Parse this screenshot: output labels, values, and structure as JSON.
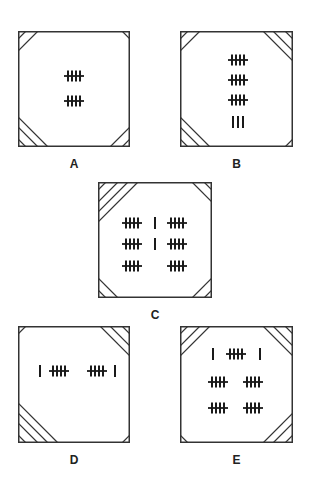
{
  "colors": {
    "stroke": "#333333",
    "background": "#ffffff"
  },
  "panels": [
    {
      "label": "A",
      "box": {
        "x": 18,
        "y": 31,
        "w": 112,
        "h": 116
      },
      "corners": {
        "tl": 2,
        "tr": 1,
        "bl": 3,
        "br": 2
      },
      "rows": [
        {
          "dy": 45,
          "items": [
            {
              "type": "five",
              "dx": 56
            }
          ]
        },
        {
          "dy": 70,
          "items": [
            {
              "type": "five",
              "dx": 56
            }
          ]
        }
      ],
      "tally_total": 10
    },
    {
      "label": "B",
      "box": {
        "x": 180,
        "y": 31,
        "w": 113,
        "h": 116
      },
      "corners": {
        "tl": 2,
        "tr": 3,
        "bl": 3,
        "br": 1
      },
      "rows": [
        {
          "dy": 29,
          "items": [
            {
              "type": "five",
              "dx": 58
            }
          ]
        },
        {
          "dy": 49,
          "items": [
            {
              "type": "five",
              "dx": 58
            }
          ]
        },
        {
          "dy": 69,
          "items": [
            {
              "type": "five",
              "dx": 58
            }
          ]
        },
        {
          "dy": 91,
          "items": [
            {
              "type": "single",
              "dx": 53
            },
            {
              "type": "single",
              "dx": 58
            },
            {
              "type": "single",
              "dx": 63
            }
          ]
        }
      ],
      "tally_total": 18
    },
    {
      "label": "C",
      "box": {
        "x": 98,
        "y": 182,
        "w": 114,
        "h": 116
      },
      "corners": {
        "tl": 4,
        "tr": 2,
        "bl": 2,
        "br": 2
      },
      "rows": [
        {
          "dy": 41,
          "items": [
            {
              "type": "five",
              "dx": 34
            },
            {
              "type": "single",
              "dx": 57
            },
            {
              "type": "five",
              "dx": 79
            }
          ]
        },
        {
          "dy": 62,
          "items": [
            {
              "type": "five",
              "dx": 34
            },
            {
              "type": "single",
              "dx": 57
            },
            {
              "type": "five",
              "dx": 79
            }
          ]
        },
        {
          "dy": 84,
          "items": [
            {
              "type": "five",
              "dx": 34
            },
            {
              "type": "five",
              "dx": 79
            }
          ]
        }
      ],
      "tally_total": 32
    },
    {
      "label": "D",
      "box": {
        "x": 18,
        "y": 326,
        "w": 112,
        "h": 117
      },
      "corners": {
        "tl": 1,
        "tr": 3,
        "bl": 4,
        "br": 1
      },
      "rows": [
        {
          "dy": 45,
          "items": [
            {
              "type": "single",
              "dx": 22
            },
            {
              "type": "five",
              "dx": 41
            },
            {
              "type": "five",
              "dx": 79
            },
            {
              "type": "single",
              "dx": 97
            }
          ]
        }
      ],
      "tally_total": 12
    },
    {
      "label": "E",
      "box": {
        "x": 180,
        "y": 326,
        "w": 113,
        "h": 117
      },
      "corners": {
        "tl": 3,
        "tr": 3,
        "bl": 1,
        "br": 3
      },
      "rows": [
        {
          "dy": 28,
          "items": [
            {
              "type": "single",
              "dx": 33
            },
            {
              "type": "five",
              "dx": 56
            },
            {
              "type": "single",
              "dx": 80
            }
          ]
        },
        {
          "dy": 56,
          "items": [
            {
              "type": "five",
              "dx": 38
            },
            {
              "type": "five",
              "dx": 73
            }
          ]
        },
        {
          "dy": 82,
          "items": [
            {
              "type": "five",
              "dx": 38
            },
            {
              "type": "five",
              "dx": 73
            }
          ]
        }
      ],
      "tally_total": 27
    }
  ]
}
